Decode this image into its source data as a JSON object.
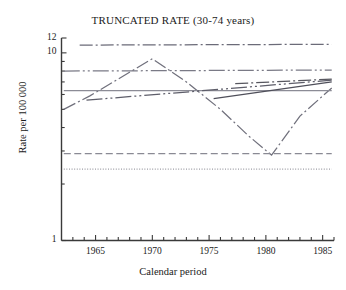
{
  "chart_data": {
    "type": "line",
    "title": "TRUNCATED RATE (30-74 years)",
    "xlabel": "Calendar period",
    "ylabel": "Rate per 100 000",
    "xlim": [
      1962,
      1986
    ],
    "ylim": [
      1,
      12
    ],
    "yscale": "log",
    "grid": false,
    "legend": "none",
    "xticks": [
      1965,
      1970,
      1975,
      1980,
      1985
    ],
    "xtick_labels": [
      "1965",
      "1970",
      "1975",
      "1980",
      "1985"
    ],
    "xminor_tick_step": 1,
    "yticks": [
      1,
      10,
      12
    ],
    "ytick_labels": [
      "1",
      "10",
      "12"
    ],
    "yminor_ticks": [
      2,
      3,
      4,
      5,
      6,
      7,
      8,
      9
    ],
    "series": [
      {
        "name": "series-1-flat-high",
        "style": "dash-dot",
        "color": "#6b6b78",
        "x": [
          1963.6,
          1985.8
        ],
        "y": [
          11.0,
          11.1
        ]
      },
      {
        "name": "series-2-flat-upper",
        "style": "dash-dot-dot",
        "color": "#7a7a86",
        "x": [
          1962.2,
          1985.8
        ],
        "y": [
          8.0,
          8.1
        ]
      },
      {
        "name": "series-3-zigzag",
        "style": "dash-dot",
        "color": "#70707c",
        "x": [
          1962.2,
          1964.5,
          1970.0,
          1973.0,
          1976.0,
          1978.5,
          1980.5,
          1983.0,
          1985.8
        ],
        "y": [
          5.0,
          5.9,
          9.3,
          7.0,
          5.0,
          3.6,
          2.85,
          4.6,
          6.5
        ]
      },
      {
        "name": "series-4-flat-mid",
        "style": "solid",
        "color": "#8c8c96",
        "x": [
          1962.2,
          1985.8
        ],
        "y": [
          6.3,
          6.3
        ]
      },
      {
        "name": "series-5-rising-long",
        "style": "dash-dot-dot",
        "color": "#5e5e6a",
        "x": [
          1964.2,
          1985.8
        ],
        "y": [
          5.6,
          7.15
        ]
      },
      {
        "name": "series-6-rising-short-dark",
        "style": "solid",
        "color": "#4f4f5a",
        "x": [
          1975.4,
          1985.8
        ],
        "y": [
          5.7,
          7.0
        ]
      },
      {
        "name": "series-7-rising-short-upper",
        "style": "dash-dot",
        "color": "#57575f",
        "x": [
          1977.3,
          1985.8
        ],
        "y": [
          6.85,
          7.25
        ]
      },
      {
        "name": "series-8-flat-low-dashed",
        "style": "dashed",
        "color": "#8a8a94",
        "x": [
          1962.2,
          1985.8
        ],
        "y": [
          2.9,
          2.9
        ]
      },
      {
        "name": "series-9-flat-lowest-dotted",
        "style": "dotted",
        "color": "#9a9aa2",
        "x": [
          1962.2,
          1985.8
        ],
        "y": [
          2.4,
          2.4
        ]
      }
    ]
  },
  "axes": {
    "frame_color": "#3a3a3a"
  }
}
